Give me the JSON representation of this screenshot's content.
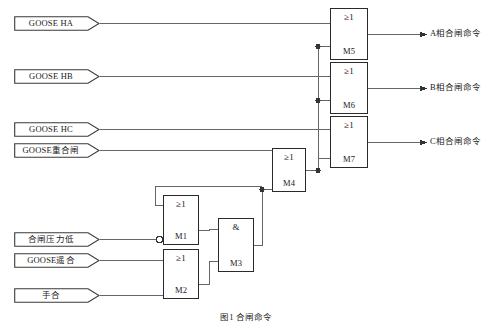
{
  "diagram": {
    "caption": "图1  合闸命令",
    "line_color": "#555555",
    "box_color": "#2a2a2a",
    "text_color": "#1a1a1a",
    "background": "#ffffff"
  },
  "inputs": [
    {
      "id": "in-goose-ha",
      "label": "GOOSE HA",
      "x": 14,
      "y": 16,
      "w": 86
    },
    {
      "id": "in-goose-hb",
      "label": "GOOSE HB",
      "x": 14,
      "y": 69,
      "w": 86
    },
    {
      "id": "in-goose-hc",
      "label": "GOOSE HC",
      "x": 14,
      "y": 122,
      "w": 86
    },
    {
      "id": "in-goose-reclose",
      "label": "GOOSE重合闸",
      "x": 14,
      "y": 143,
      "w": 86
    },
    {
      "id": "in-close-pressure-low",
      "label": "合闸压力低",
      "x": 14,
      "y": 232,
      "w": 86
    },
    {
      "id": "in-goose-remote-close",
      "label": "GOOSE遥合",
      "x": 14,
      "y": 253,
      "w": 86
    },
    {
      "id": "in-manual-close",
      "label": "手合",
      "x": 14,
      "y": 288,
      "w": 86
    }
  ],
  "gates": [
    {
      "id": "gate-m5",
      "symbol": "≥1",
      "label": "M5",
      "x": 330,
      "y": 8,
      "w": 38,
      "h": 52
    },
    {
      "id": "gate-m6",
      "symbol": "≥1",
      "label": "M6",
      "x": 330,
      "y": 62,
      "w": 38,
      "h": 52
    },
    {
      "id": "gate-m7",
      "symbol": "≥1",
      "label": "M7",
      "x": 330,
      "y": 116,
      "w": 38,
      "h": 52
    },
    {
      "id": "gate-m4",
      "symbol": "≥1",
      "label": "M4",
      "x": 272,
      "y": 148,
      "w": 34,
      "h": 44
    },
    {
      "id": "gate-m1",
      "symbol": "≥1",
      "label": "M1",
      "x": 163,
      "y": 195,
      "w": 36,
      "h": 50
    },
    {
      "id": "gate-m2",
      "symbol": "≥1",
      "label": "M2",
      "x": 163,
      "y": 249,
      "w": 36,
      "h": 50
    },
    {
      "id": "gate-m3",
      "symbol": "&",
      "label": "M3",
      "x": 218,
      "y": 218,
      "w": 36,
      "h": 54
    }
  ],
  "outputs": [
    {
      "id": "out-phase-a",
      "label": "A相合闸命令",
      "x": 424,
      "y": 28
    },
    {
      "id": "out-phase-b",
      "label": "B相合闸命令",
      "x": 424,
      "y": 82
    },
    {
      "id": "out-phase-c",
      "label": "C相合闸命令",
      "x": 424,
      "y": 136
    }
  ],
  "annotations": {
    "inverter_on": "M1",
    "inverter_note": "合闸压力低 input is inverted (bubble)"
  }
}
